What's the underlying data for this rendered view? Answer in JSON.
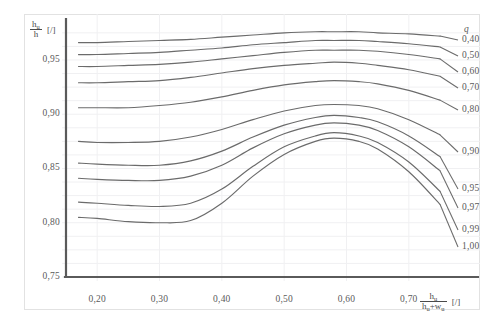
{
  "chart_data": {
    "type": "line",
    "title": "",
    "xlabel": "h_u / (h_u + w_u) [/]",
    "ylabel": "h_u / h [/]",
    "xlim": [
      0.15,
      0.75
    ],
    "ylim": [
      0.75,
      0.985
    ],
    "grid": true,
    "legend_position": "right",
    "legend_title": "q",
    "x_ticks": [
      "0,20",
      "0,30",
      "0,40",
      "0,50",
      "0,60",
      "0,70"
    ],
    "x_tick_values": [
      0.2,
      0.3,
      0.4,
      0.5,
      0.6,
      0.7
    ],
    "y_ticks": [
      "0,75",
      "0,80",
      "0,85",
      "0,90",
      "0,95"
    ],
    "y_tick_values": [
      0.75,
      0.8,
      0.85,
      0.9,
      0.95
    ],
    "x": [
      0.17,
      0.2,
      0.25,
      0.3,
      0.35,
      0.4,
      0.45,
      0.5,
      0.55,
      0.58,
      0.62,
      0.65,
      0.7,
      0.75
    ],
    "series": [
      {
        "name": "0,40",
        "values": [
          0.966,
          0.966,
          0.967,
          0.968,
          0.969,
          0.971,
          0.973,
          0.975,
          0.976,
          0.976,
          0.976,
          0.975,
          0.974,
          0.972
        ]
      },
      {
        "name": "0,50",
        "values": [
          0.955,
          0.955,
          0.956,
          0.957,
          0.959,
          0.961,
          0.964,
          0.966,
          0.968,
          0.968,
          0.968,
          0.967,
          0.965,
          0.962
        ]
      },
      {
        "name": "0,60",
        "values": [
          0.944,
          0.944,
          0.945,
          0.946,
          0.948,
          0.951,
          0.954,
          0.957,
          0.959,
          0.959,
          0.959,
          0.958,
          0.955,
          0.951
        ]
      },
      {
        "name": "0,70",
        "values": [
          0.929,
          0.929,
          0.93,
          0.931,
          0.934,
          0.938,
          0.942,
          0.945,
          0.947,
          0.948,
          0.947,
          0.945,
          0.941,
          0.935
        ]
      },
      {
        "name": "0,80",
        "values": [
          0.906,
          0.906,
          0.906,
          0.908,
          0.911,
          0.916,
          0.922,
          0.927,
          0.93,
          0.931,
          0.93,
          0.928,
          0.922,
          0.913
        ]
      },
      {
        "name": "0,90",
        "values": [
          0.875,
          0.874,
          0.874,
          0.875,
          0.879,
          0.886,
          0.895,
          0.903,
          0.908,
          0.909,
          0.908,
          0.905,
          0.895,
          0.881
        ]
      },
      {
        "name": "0,95",
        "values": [
          0.855,
          0.854,
          0.853,
          0.853,
          0.857,
          0.866,
          0.879,
          0.89,
          0.897,
          0.899,
          0.897,
          0.893,
          0.88,
          0.861
        ]
      },
      {
        "name": "0,97",
        "values": [
          0.841,
          0.84,
          0.839,
          0.839,
          0.843,
          0.853,
          0.869,
          0.882,
          0.89,
          0.892,
          0.89,
          0.885,
          0.87,
          0.848
        ]
      },
      {
        "name": "0,99",
        "values": [
          0.819,
          0.818,
          0.816,
          0.815,
          0.818,
          0.831,
          0.852,
          0.87,
          0.88,
          0.883,
          0.88,
          0.874,
          0.856,
          0.829
        ]
      },
      {
        "name": "1,00",
        "values": [
          0.805,
          0.804,
          0.801,
          0.8,
          0.802,
          0.818,
          0.843,
          0.863,
          0.875,
          0.878,
          0.875,
          0.868,
          0.847,
          0.817
        ]
      }
    ],
    "curve_color": "#6b6b6b",
    "axis_color": "#5a5a5a",
    "grid_color": "#f0f0f2"
  },
  "axes": {
    "y_title": {
      "numerator": "h",
      "numerator_sub": "u",
      "denominator": "h",
      "unit": "[/]"
    },
    "x_title": {
      "numerator": "h",
      "numerator_sub": "u",
      "denominator_a": "h",
      "denominator_a_sub": "u",
      "denominator_op": "+w",
      "denominator_b_sub": "u",
      "unit": "[/]"
    }
  },
  "legend": {
    "header": "q",
    "labels": [
      "0,40",
      "0,50",
      "0,60",
      "0,70",
      "0,80",
      "0,90",
      "0,95",
      "0,97",
      "0,99",
      "1,00"
    ]
  }
}
